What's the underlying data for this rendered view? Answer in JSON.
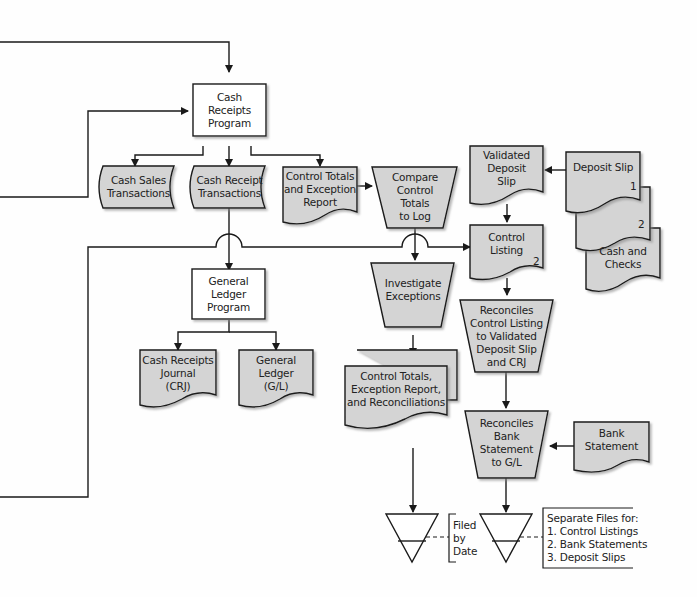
{
  "diagram": {
    "type": "flowchart",
    "colors": {
      "fill": "#d4d4d4",
      "stroke": "#1a1a1a",
      "background": "#ffffff"
    },
    "nodes": {
      "cash_receipts_program": {
        "shape": "process",
        "label": "Cash\nReceipts\nProgram"
      },
      "cash_sales_transactions": {
        "shape": "storage",
        "label": "Cash Sales\nTransactions"
      },
      "cash_receipt_transactions": {
        "shape": "storage",
        "label": "Cash Receipt\nTransactions"
      },
      "control_totals_exception_report": {
        "shape": "document",
        "label": "Control Totals\nand Exception\nReport"
      },
      "compare_control_totals": {
        "shape": "manual-operation",
        "label": "Compare\nControl\nTotals\nto Log"
      },
      "validated_deposit_slip": {
        "shape": "document",
        "label": "Validated\nDeposit\nSlip"
      },
      "deposit_slip": {
        "shape": "document",
        "label": "Deposit Slip",
        "copy": "1"
      },
      "deposit_slip_copy2": {
        "shape": "document",
        "copy": "2"
      },
      "cash_and_checks": {
        "shape": "document",
        "label": "Cash and\nChecks"
      },
      "control_listing": {
        "shape": "document",
        "label": "Control\nListing",
        "copy": "2"
      },
      "general_ledger_program": {
        "shape": "process",
        "label": "General\nLedger\nProgram"
      },
      "investigate_exceptions": {
        "shape": "manual-operation",
        "label": "Investigate\nExceptions"
      },
      "reconciles_control_listing": {
        "shape": "manual-operation",
        "label": "Reconciles\nControl Listing\nto Validated\nDeposit Slip\nand CRJ"
      },
      "cash_receipts_journal": {
        "shape": "document",
        "label": "Cash Receipts\nJournal\n(CRJ)"
      },
      "general_ledger": {
        "shape": "document",
        "label": "General\nLedger\n(G/L)"
      },
      "control_totals_reconciliations": {
        "shape": "multi-document",
        "label": "Control Totals,\nException Report,\nand Reconciliations"
      },
      "reconciles_bank_statement": {
        "shape": "manual-operation",
        "label": "Reconciles\nBank\nStatement\nto G/L"
      },
      "bank_statement": {
        "shape": "document",
        "label": "Bank\nStatement"
      },
      "file_by_date": {
        "shape": "offline-file"
      },
      "file_separate": {
        "shape": "offline-file"
      }
    },
    "annotations": {
      "filed_by_date": "Filed\nby\nDate",
      "separate_files": "Separate Files for:\n1. Control Listings\n2. Bank Statements\n3. Deposit Slips"
    },
    "edges": [
      [
        "offpage-left-top",
        "cash_receipts_program"
      ],
      [
        "offpage-left-mid",
        "cash_receipts_program"
      ],
      [
        "cash_receipts_program",
        "cash_sales_transactions"
      ],
      [
        "cash_receipts_program",
        "cash_receipt_transactions"
      ],
      [
        "cash_receipts_program",
        "control_totals_exception_report"
      ],
      [
        "control_totals_exception_report",
        "compare_control_totals"
      ],
      [
        "cash_receipt_transactions",
        "general_ledger_program"
      ],
      [
        "compare_control_totals",
        "investigate_exceptions"
      ],
      [
        "offpage-left-bottom",
        "control_listing"
      ],
      [
        "deposit_slip",
        "validated_deposit_slip"
      ],
      [
        "validated_deposit_slip",
        "control_listing"
      ],
      [
        "control_listing",
        "reconciles_control_listing"
      ],
      [
        "general_ledger_program",
        "cash_receipts_journal"
      ],
      [
        "general_ledger_program",
        "general_ledger"
      ],
      [
        "investigate_exceptions",
        "control_totals_reconciliations"
      ],
      [
        "reconciles_control_listing",
        "reconciles_bank_statement"
      ],
      [
        "bank_statement",
        "reconciles_bank_statement"
      ],
      [
        "control_totals_reconciliations",
        "file_by_date"
      ],
      [
        "reconciles_bank_statement",
        "file_separate"
      ]
    ]
  }
}
